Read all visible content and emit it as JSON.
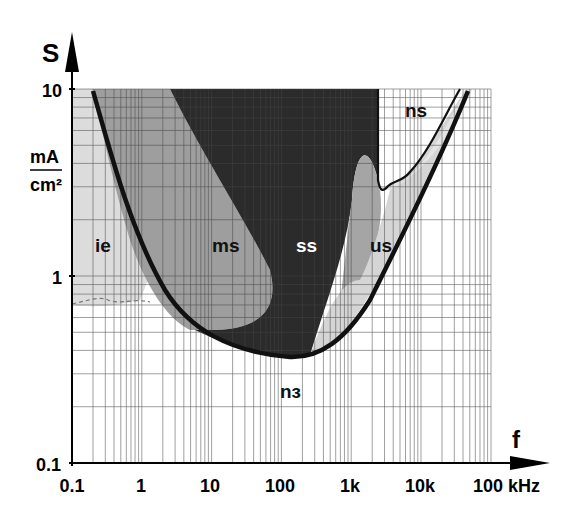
{
  "chart_data": {
    "type": "area",
    "title": "",
    "xlabel": "f",
    "ylabel": "S",
    "y_unit_numerator": "mA",
    "y_unit_denominator": "cm²",
    "x_scale": "log",
    "y_scale": "log",
    "xlim": [
      0.1,
      100
    ],
    "ylim": [
      0.1,
      10
    ],
    "x_unit": "kHz",
    "x_ticks": [
      "0.1",
      "1",
      "10",
      "100",
      "1k",
      "10k",
      "100 kHz"
    ],
    "y_ticks": [
      "0.1",
      "1",
      "10"
    ],
    "grid": true,
    "regions": [
      {
        "name": "ie",
        "label": "ie",
        "fill": "#d9d9d9"
      },
      {
        "name": "ms",
        "label": "ms",
        "fill": "#9a9a9a"
      },
      {
        "name": "ss",
        "label": "ss",
        "fill": "#2a2a2a"
      },
      {
        "name": "us",
        "label": "us",
        "fill": "#a8a8a8"
      },
      {
        "name": "ns",
        "label": "ns",
        "fill": "#ffffff"
      },
      {
        "name": "nз",
        "label": "nз",
        "fill": "#ffffff"
      }
    ],
    "threshold_curve": {
      "x_hz": [
        0.2,
        1,
        10,
        100,
        300,
        1000,
        10000,
        45000
      ],
      "s_mA_cm2": [
        10,
        1.6,
        0.5,
        0.35,
        0.37,
        0.6,
        2.2,
        10
      ]
    },
    "ns_boundary": {
      "x_hz": [
        2500,
        2800,
        3500,
        5000,
        15000,
        30000
      ],
      "s_mA_cm2": [
        10,
        3.2,
        3.3,
        3.6,
        6.5,
        10
      ]
    }
  },
  "axis": {
    "y_title": "S",
    "y_unit_num": "mA",
    "y_unit_den": "cm²",
    "x_title": "f",
    "y_tick_10": "10",
    "y_tick_1": "1",
    "y_tick_01": "0.1",
    "x_ticks": [
      "0.1",
      "1",
      "10",
      "100",
      "1k",
      "10k",
      "100 kHz"
    ]
  },
  "labels": {
    "ie": "ie",
    "ms": "ms",
    "ss": "ss",
    "us": "us",
    "ns": "ns",
    "n3": "nз"
  }
}
